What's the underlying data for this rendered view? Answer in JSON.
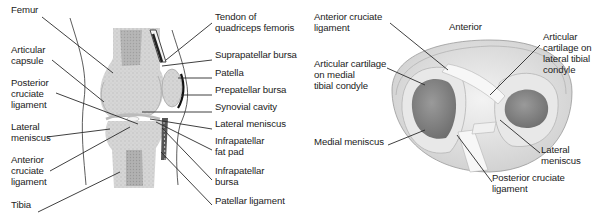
{
  "sagittal_view": {
    "left_labels": [
      {
        "text": "Femur",
        "x": 11,
        "y": 10
      },
      {
        "text": "Articular\ncapsule",
        "x": 11,
        "y": 50
      },
      {
        "text": "Posterior\ncruciate\nligament",
        "x": 11,
        "y": 83
      },
      {
        "text": "Lateral\nmeniscus",
        "x": 11,
        "y": 127
      },
      {
        "text": "Anterior\ncruciate\nligament",
        "x": 11,
        "y": 160
      },
      {
        "text": "Tibia",
        "x": 11,
        "y": 205
      }
    ],
    "right_labels": [
      {
        "text": "Tendon of\nquadriceps femoris",
        "x": 215,
        "y": 17
      },
      {
        "text": "Suprapatellar bursa",
        "x": 215,
        "y": 55
      },
      {
        "text": "Patella",
        "x": 215,
        "y": 73
      },
      {
        "text": "Prepatellar bursa",
        "x": 215,
        "y": 90
      },
      {
        "text": "Synovial cavity",
        "x": 215,
        "y": 107
      },
      {
        "text": "Lateral meniscus",
        "x": 215,
        "y": 124
      },
      {
        "text": "Infrapatellar\nfat pad",
        "x": 215,
        "y": 141
      },
      {
        "text": "Infrapatellar\nbursa",
        "x": 215,
        "y": 171
      },
      {
        "text": "Patellar ligament",
        "x": 215,
        "y": 200
      }
    ]
  },
  "superior_view": {
    "labels": [
      {
        "text": "Anterior cruciate\nligament",
        "x": 314,
        "y": 17
      },
      {
        "text": "Anterior",
        "x": 447,
        "y": 27
      },
      {
        "text": "Articular cartilage\non medial\ntibial condyle",
        "x": 314,
        "y": 64
      },
      {
        "text": "Articular\ncartilage on\nlateral tibial\ncondyle",
        "x": 543,
        "y": 37
      },
      {
        "text": "Medial meniscus",
        "x": 314,
        "y": 141
      },
      {
        "text": "Lateral\nmeniscus",
        "x": 541,
        "y": 149
      },
      {
        "text": "Posterior cruciate\nligament",
        "x": 492,
        "y": 178
      }
    ]
  },
  "colors": {
    "leader_line": "#2a2a2a",
    "bone_fill": "#d9d9d9",
    "cartilage_dark": "#8c8c8c",
    "meniscus_fill": "#e6e6e6",
    "text": "#222222"
  }
}
